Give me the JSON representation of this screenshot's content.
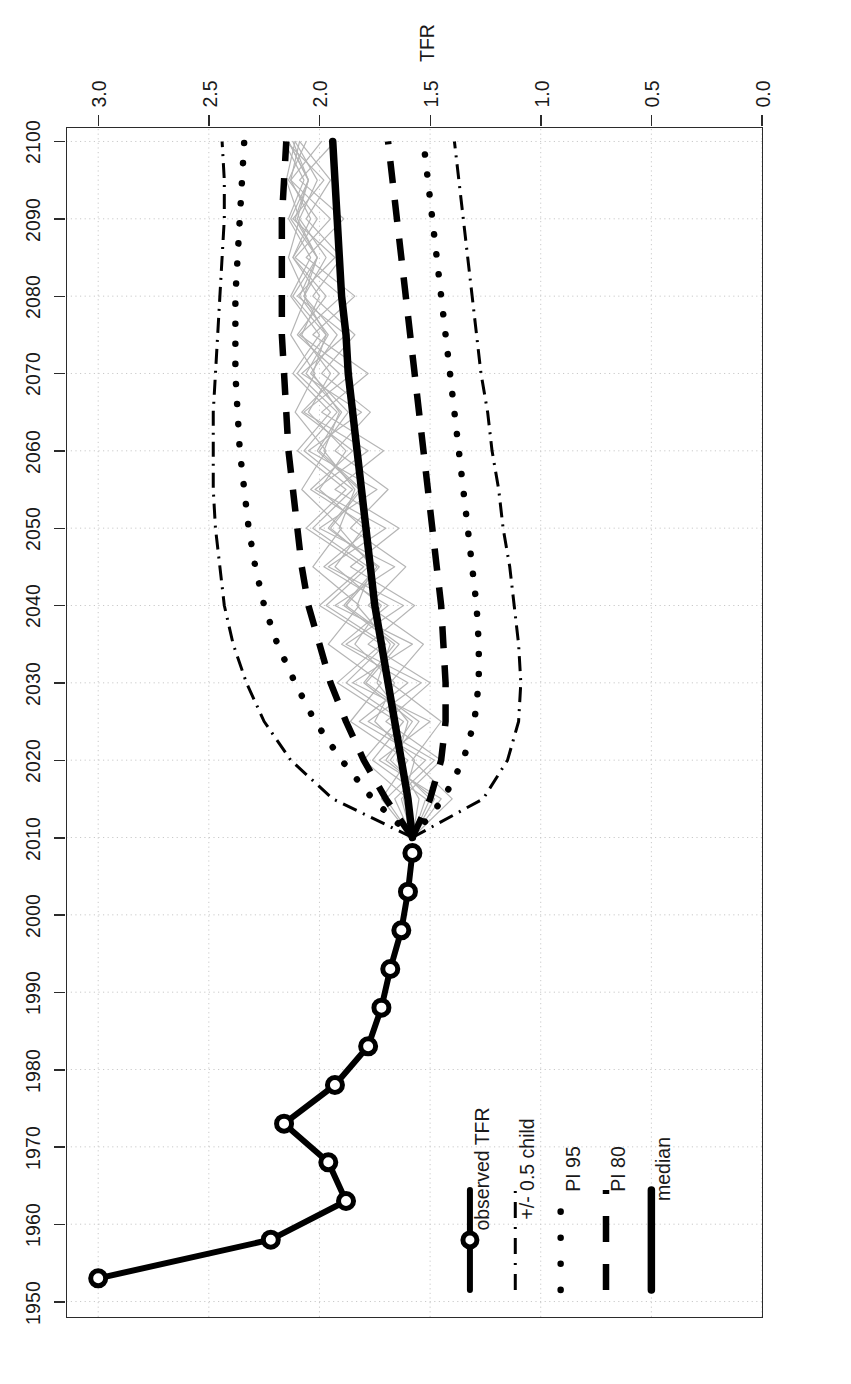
{
  "chart_data": {
    "type": "line",
    "title": "",
    "xlabel": "Year",
    "ylabel": "TFR",
    "xlim": [
      1948,
      2102
    ],
    "ylim": [
      0.0,
      3.15
    ],
    "grid": true,
    "grid_style": "dotted-light-gray",
    "xticks": [
      1950,
      1960,
      1970,
      1980,
      1990,
      2000,
      2010,
      2020,
      2030,
      2040,
      2050,
      2060,
      2070,
      2080,
      2090,
      2100
    ],
    "yticks": [
      "0.0",
      "0.5",
      "1.0",
      "1.5",
      "2.0",
      "2.5",
      "3.0"
    ],
    "ytick_values": [
      0.0,
      0.5,
      1.0,
      1.5,
      2.0,
      2.5,
      3.0
    ],
    "legend_position": "bottom-right",
    "legend": [
      {
        "label": "median",
        "style": "solid-thick",
        "color": "#000000"
      },
      {
        "label": "PI 80",
        "style": "dashed",
        "color": "#000000"
      },
      {
        "label": "PI 95",
        "style": "dotted",
        "color": "#000000"
      },
      {
        "label": "+/- 0.5 child",
        "style": "dash-dot",
        "color": "#000000"
      },
      {
        "label": "observed TFR",
        "style": "solid-circle",
        "color": "#000000"
      }
    ],
    "series": [
      {
        "name": "observed TFR",
        "style": "solid-circle",
        "x": [
          1953,
          1958,
          1963,
          1968,
          1973,
          1978,
          1983,
          1988,
          1993,
          1998,
          2003,
          2008
        ],
        "values": [
          3.0,
          2.22,
          1.88,
          1.96,
          2.16,
          1.93,
          1.78,
          1.72,
          1.68,
          1.63,
          1.6,
          1.58
        ]
      },
      {
        "name": "median",
        "style": "solid-thick",
        "x": [
          2010,
          2015,
          2020,
          2025,
          2030,
          2035,
          2040,
          2045,
          2050,
          2055,
          2060,
          2065,
          2070,
          2075,
          2080,
          2085,
          2090,
          2095,
          2100
        ],
        "values": [
          1.58,
          1.6,
          1.63,
          1.66,
          1.69,
          1.72,
          1.75,
          1.77,
          1.79,
          1.81,
          1.83,
          1.85,
          1.87,
          1.88,
          1.9,
          1.91,
          1.92,
          1.93,
          1.94
        ]
      },
      {
        "name": "PI 80 upper",
        "style": "dashed",
        "x": [
          2010,
          2015,
          2020,
          2025,
          2030,
          2035,
          2040,
          2045,
          2050,
          2055,
          2060,
          2065,
          2070,
          2075,
          2080,
          2085,
          2090,
          2095,
          2100
        ],
        "values": [
          1.58,
          1.7,
          1.8,
          1.88,
          1.95,
          2.0,
          2.05,
          2.08,
          2.1,
          2.12,
          2.14,
          2.15,
          2.16,
          2.17,
          2.17,
          2.17,
          2.17,
          2.16,
          2.15
        ]
      },
      {
        "name": "PI 80 lower",
        "style": "dashed",
        "x": [
          2010,
          2015,
          2020,
          2025,
          2030,
          2035,
          2040,
          2045,
          2050,
          2055,
          2060,
          2065,
          2070,
          2075,
          2080,
          2085,
          2090,
          2095,
          2100
        ],
        "values": [
          1.58,
          1.5,
          1.45,
          1.43,
          1.43,
          1.44,
          1.45,
          1.47,
          1.49,
          1.51,
          1.53,
          1.55,
          1.57,
          1.59,
          1.61,
          1.63,
          1.65,
          1.67,
          1.69
        ]
      },
      {
        "name": "PI 95 upper",
        "style": "dotted",
        "x": [
          2010,
          2015,
          2020,
          2025,
          2030,
          2035,
          2040,
          2045,
          2050,
          2055,
          2060,
          2065,
          2070,
          2075,
          2080,
          2085,
          2090,
          2095,
          2100
        ],
        "values": [
          1.58,
          1.76,
          1.9,
          2.02,
          2.11,
          2.19,
          2.25,
          2.29,
          2.32,
          2.34,
          2.36,
          2.37,
          2.38,
          2.38,
          2.38,
          2.37,
          2.36,
          2.35,
          2.34
        ]
      },
      {
        "name": "PI 95 lower",
        "style": "dotted",
        "x": [
          2010,
          2015,
          2020,
          2025,
          2030,
          2035,
          2040,
          2045,
          2050,
          2055,
          2060,
          2065,
          2070,
          2075,
          2080,
          2085,
          2090,
          2095,
          2100
        ],
        "values": [
          1.58,
          1.44,
          1.35,
          1.3,
          1.28,
          1.28,
          1.29,
          1.31,
          1.33,
          1.35,
          1.37,
          1.39,
          1.41,
          1.43,
          1.45,
          1.47,
          1.49,
          1.51,
          1.53
        ]
      },
      {
        "name": "+/- 0.5 child upper",
        "style": "dash-dot",
        "x": [
          2010,
          2015,
          2020,
          2025,
          2030,
          2035,
          2040,
          2045,
          2050,
          2055,
          2060,
          2065,
          2070,
          2075,
          2080,
          2085,
          2090,
          2095,
          2100
        ],
        "values": [
          1.58,
          1.94,
          2.13,
          2.25,
          2.33,
          2.39,
          2.43,
          2.45,
          2.47,
          2.48,
          2.48,
          2.48,
          2.47,
          2.46,
          2.45,
          2.44,
          2.43,
          2.43,
          2.44
        ]
      },
      {
        "name": "+/- 0.5 child lower",
        "style": "dash-dot",
        "x": [
          2010,
          2015,
          2020,
          2025,
          2030,
          2035,
          2040,
          2045,
          2050,
          2055,
          2060,
          2065,
          2070,
          2075,
          2080,
          2085,
          2090,
          2095,
          2100
        ],
        "values": [
          1.58,
          1.26,
          1.15,
          1.1,
          1.09,
          1.1,
          1.12,
          1.14,
          1.17,
          1.19,
          1.22,
          1.24,
          1.27,
          1.29,
          1.31,
          1.33,
          1.35,
          1.37,
          1.39
        ]
      }
    ],
    "trajectories": {
      "name": "sample trajectories",
      "style": "thin-gray",
      "color": "#b5b5b5",
      "count": 12,
      "x": [
        2010,
        2015,
        2020,
        2025,
        2030,
        2035,
        2040,
        2045,
        2050,
        2055,
        2060,
        2065,
        2070,
        2075,
        2080,
        2085,
        2090,
        2095,
        2100
      ],
      "values": [
        [
          1.58,
          1.62,
          1.57,
          1.75,
          1.66,
          1.84,
          1.72,
          1.93,
          1.8,
          2.0,
          1.88,
          2.05,
          1.95,
          2.08,
          2.0,
          2.12,
          2.04,
          2.13,
          2.09
        ],
        [
          1.58,
          1.5,
          1.68,
          1.55,
          1.79,
          1.64,
          1.88,
          1.73,
          1.96,
          1.82,
          2.01,
          1.9,
          2.06,
          1.96,
          2.09,
          2.01,
          2.11,
          2.05,
          2.14
        ],
        [
          1.58,
          1.7,
          1.52,
          1.82,
          1.6,
          1.9,
          1.69,
          1.98,
          1.77,
          2.04,
          1.85,
          2.08,
          1.91,
          2.1,
          1.97,
          2.12,
          2.01,
          2.14,
          2.06
        ],
        [
          1.58,
          1.45,
          1.73,
          1.5,
          1.85,
          1.58,
          1.93,
          1.66,
          2.0,
          1.74,
          2.05,
          1.81,
          2.08,
          1.88,
          2.1,
          1.93,
          2.12,
          1.98,
          2.15
        ],
        [
          1.58,
          1.66,
          1.48,
          1.78,
          1.54,
          1.88,
          1.62,
          1.96,
          1.7,
          2.02,
          1.78,
          2.07,
          1.85,
          2.09,
          1.9,
          2.11,
          1.95,
          2.13,
          1.99
        ],
        [
          1.58,
          1.55,
          1.65,
          1.6,
          1.74,
          1.68,
          1.83,
          1.76,
          1.91,
          1.84,
          1.98,
          1.91,
          2.03,
          1.97,
          2.07,
          2.01,
          2.1,
          2.05,
          2.12
        ],
        [
          1.58,
          1.6,
          1.8,
          1.65,
          1.92,
          1.72,
          2.0,
          1.8,
          2.06,
          1.88,
          2.1,
          1.95,
          2.12,
          2.0,
          2.13,
          2.04,
          2.14,
          2.07,
          2.16
        ],
        [
          1.58,
          1.4,
          1.58,
          1.45,
          1.68,
          1.53,
          1.78,
          1.61,
          1.86,
          1.69,
          1.93,
          1.77,
          1.99,
          1.84,
          2.03,
          1.9,
          2.06,
          1.95,
          2.09
        ],
        [
          1.58,
          1.72,
          1.6,
          1.86,
          1.72,
          1.96,
          1.82,
          2.03,
          1.9,
          2.08,
          1.97,
          2.11,
          2.02,
          2.13,
          2.06,
          2.14,
          2.09,
          2.15,
          2.11
        ],
        [
          1.58,
          1.48,
          1.7,
          1.58,
          1.8,
          1.66,
          1.89,
          1.74,
          1.95,
          1.81,
          2.0,
          1.87,
          2.04,
          1.92,
          2.07,
          1.97,
          2.09,
          2.01,
          2.11
        ],
        [
          1.58,
          1.63,
          1.45,
          1.7,
          1.5,
          1.78,
          1.57,
          1.86,
          1.64,
          1.93,
          1.71,
          1.99,
          1.78,
          2.03,
          1.84,
          2.06,
          1.89,
          2.09,
          1.93
        ],
        [
          1.58,
          1.52,
          1.76,
          1.62,
          1.88,
          1.7,
          1.97,
          1.78,
          2.03,
          1.85,
          2.07,
          1.92,
          2.1,
          1.97,
          2.12,
          2.01,
          2.13,
          2.05,
          2.14
        ]
      ]
    }
  },
  "axes": {
    "x": {
      "title": "Year",
      "ticks": [
        "1950",
        "1960",
        "1970",
        "1980",
        "1990",
        "2000",
        "2010",
        "2020",
        "2030",
        "2040",
        "2050",
        "2060",
        "2070",
        "2080",
        "2090",
        "2100"
      ]
    },
    "y": {
      "title": "TFR",
      "ticks": [
        "0.0",
        "0.5",
        "1.0",
        "1.5",
        "2.0",
        "2.5",
        "3.0"
      ]
    }
  },
  "legend": {
    "items": [
      {
        "label": "median"
      },
      {
        "label": "PI 80"
      },
      {
        "label": "PI 95"
      },
      {
        "label": "+/- 0.5 child"
      },
      {
        "label": "observed TFR"
      }
    ]
  },
  "colors": {
    "line": "#000000",
    "grid": "#c9c9c9",
    "frame": "#2b2b2b",
    "trajectory": "#b5b5b5",
    "background": "#ffffff"
  }
}
